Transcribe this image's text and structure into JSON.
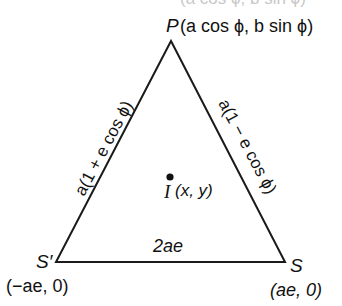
{
  "diagram": {
    "type": "triangle",
    "stroke_color": "#1a1a1a",
    "background": "#ffffff",
    "top_cut_text": "(a cos ϕ, b sin ϕ)",
    "vertices": {
      "P": {
        "name": "P",
        "coords": "(a cos ϕ, b sin ϕ)",
        "x": 171,
        "y": 41
      },
      "S_prime": {
        "name": "S′",
        "coords": "(−ae, 0)",
        "x": 56,
        "y": 262
      },
      "S": {
        "name": "S",
        "coords": "(ae, 0)",
        "x": 285,
        "y": 262
      }
    },
    "sides": {
      "left": "a(1 + e cos ϕ)",
      "right": "a(1 − e cos ϕ)",
      "base": "2ae"
    },
    "incenter": {
      "name": "I",
      "coords": "(x, y)",
      "x": 170,
      "y": 177
    }
  }
}
